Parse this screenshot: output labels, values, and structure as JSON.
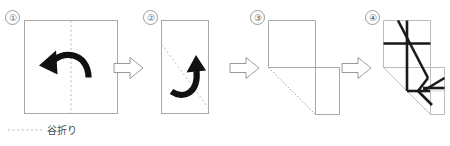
{
  "figure": {
    "width": 450,
    "height": 146,
    "background": "#ffffff"
  },
  "colors": {
    "paper_outline": "#a8a8a8",
    "fold_dash": "#b9b9b9",
    "crease_heavy": "#1a1a1a",
    "arrow_fold": "#111111",
    "arrow_step_outline": "#9a9a9a",
    "step_number_text": "#5a5a5a",
    "legend_text": "#4a4a4a"
  },
  "steps": [
    {
      "number": "①",
      "name": "step-1-square-with-vertical-valley-fold",
      "shape": "square",
      "fold_line": "vertical-center",
      "fold_type": "valley",
      "arrow": "curved-right-to-left"
    },
    {
      "number": "②",
      "name": "step-2-half-rectangle-with-diagonal-valley-fold",
      "shape": "tall-rectangle",
      "fold_line": "diagonal-top-left-to-bottom-right",
      "fold_type": "valley",
      "arrow": "curved-upward"
    },
    {
      "number": "③",
      "name": "step-3-folded-result-outline",
      "shape": "stepped-polygon-with-diagonal",
      "fold_line": "diagonal",
      "fold_type": "valley",
      "arrow": "none"
    },
    {
      "number": "④",
      "name": "step-4-unfolded-crease-pattern",
      "shape": "stepped-polygon-with-crease-pattern",
      "fold_line": "multiple-creases",
      "fold_type": "result",
      "arrow": "none"
    }
  ],
  "transition_arrows": [
    {
      "name": "arrow-step-1-to-2",
      "direction": "right"
    },
    {
      "name": "arrow-step-2-to-3",
      "direction": "right"
    },
    {
      "name": "arrow-step-3-to-4",
      "direction": "right"
    }
  ],
  "legend": {
    "label": "谷折り",
    "line_style": "dotted",
    "meaning": "valley-fold"
  }
}
